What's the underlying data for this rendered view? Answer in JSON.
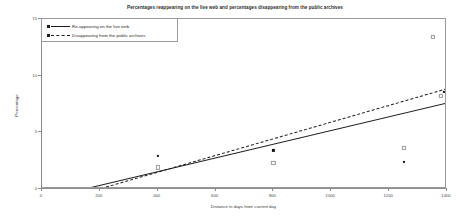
{
  "chart_data": {
    "type": "scatter",
    "title": "Percentages reappearing on the live web and percentages disappearing from the public archives",
    "xlabel": "Distance in days from current day",
    "ylabel": "Percentage",
    "xlim": [
      0,
      1400
    ],
    "ylim": [
      0,
      15
    ],
    "xticks": [
      0,
      200,
      400,
      600,
      800,
      1000,
      1200,
      1400
    ],
    "xticklabels": [
      "0",
      "200",
      "400",
      "600",
      "800",
      "1000",
      "1200",
      "1400"
    ],
    "yticks": [
      0,
      5,
      10,
      15
    ],
    "yticklabels": [
      "0",
      "5",
      "10",
      "15"
    ],
    "grid": false,
    "legend_position": "top-left",
    "legend": [
      {
        "label": "Re-appearing on the live web",
        "style": "solid",
        "marker": "square"
      },
      {
        "label": "Disappearing from the public archives",
        "style": "dashed",
        "marker": "square"
      }
    ],
    "series": [
      {
        "name": "Re-appearing on the live web",
        "style": "solid",
        "points": [
          {
            "x": 400,
            "y": 2.9
          },
          {
            "x": 800,
            "y": 3.4
          },
          {
            "x": 1250,
            "y": 2.4
          },
          {
            "x": 1390,
            "y": 8.6
          },
          {
            "x": 1400,
            "y": 8.9
          }
        ],
        "fit_line": {
          "x0": 170,
          "y0": 0.15,
          "x1": 1400,
          "y1": 7.6
        }
      },
      {
        "name": "Disappearing from the public archives",
        "style": "dashed",
        "points": [
          {
            "x": 400,
            "y": 1.9
          },
          {
            "x": 800,
            "y": 2.3
          },
          {
            "x": 1250,
            "y": 3.6
          },
          {
            "x": 1350,
            "y": 13.4
          },
          {
            "x": 1380,
            "y": 8.2
          }
        ],
        "fit_line": {
          "x0": 205,
          "y0": 0.1,
          "x1": 1400,
          "y1": 8.9
        }
      }
    ]
  }
}
